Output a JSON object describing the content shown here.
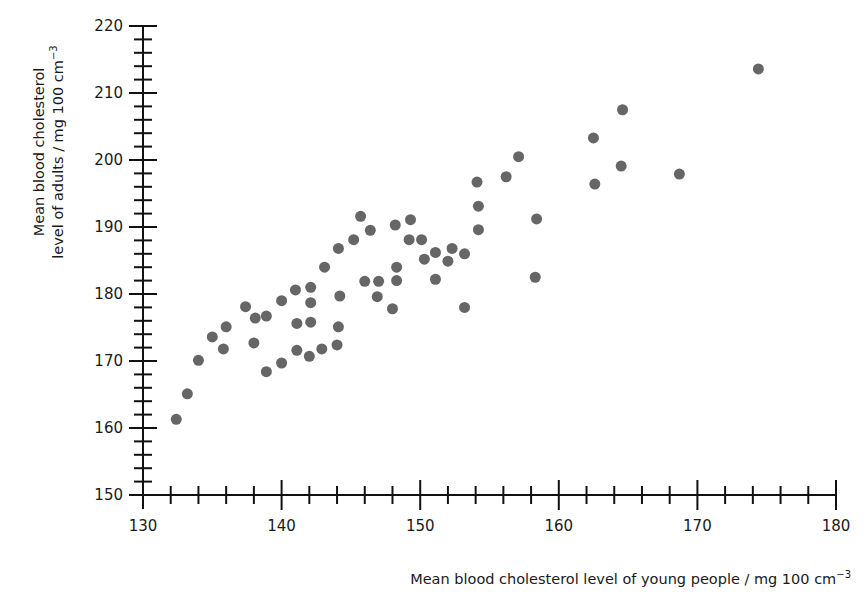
{
  "chart_data": {
    "type": "scatter",
    "title": "",
    "xlabel": "Mean blood cholesterol level of young people / mg 100 cm",
    "xlabel_sup": "−3",
    "ylabel_line1": "Mean blood cholesterol",
    "ylabel_line2": "level of adults / mg 100 cm",
    "ylabel_sup": "−3",
    "xlim": [
      130,
      180
    ],
    "ylim": [
      150,
      220
    ],
    "x_major_ticks": [
      130,
      140,
      150,
      160,
      170,
      180
    ],
    "x_minor_step": 2,
    "y_major_ticks": [
      150,
      160,
      170,
      180,
      190,
      200,
      210,
      220
    ],
    "y_minor_step": 2,
    "grid": false,
    "legend": null,
    "marker_color": "#666666",
    "series": [
      {
        "name": "countries",
        "points": [
          [
            132.4,
            161.3
          ],
          [
            133.2,
            165.1
          ],
          [
            134.0,
            170.1
          ],
          [
            135.0,
            173.6
          ],
          [
            135.8,
            171.8
          ],
          [
            136.0,
            175.1
          ],
          [
            137.4,
            178.1
          ],
          [
            138.1,
            176.4
          ],
          [
            138.9,
            176.7
          ],
          [
            138.0,
            172.7
          ],
          [
            138.9,
            168.4
          ],
          [
            140.0,
            179.0
          ],
          [
            140.0,
            169.7
          ],
          [
            141.0,
            180.6
          ],
          [
            142.1,
            181.0
          ],
          [
            141.1,
            175.6
          ],
          [
            142.1,
            178.7
          ],
          [
            142.1,
            175.8
          ],
          [
            141.1,
            171.6
          ],
          [
            142.0,
            170.7
          ],
          [
            142.9,
            171.8
          ],
          [
            143.1,
            184.0
          ],
          [
            144.2,
            179.7
          ],
          [
            144.1,
            175.1
          ],
          [
            144.0,
            172.4
          ],
          [
            144.1,
            186.8
          ],
          [
            145.2,
            188.1
          ],
          [
            145.7,
            191.6
          ],
          [
            146.4,
            189.5
          ],
          [
            146.0,
            181.9
          ],
          [
            147.0,
            181.9
          ],
          [
            146.9,
            179.6
          ],
          [
            148.2,
            190.3
          ],
          [
            148.3,
            184.0
          ],
          [
            148.3,
            182.0
          ],
          [
            148.0,
            177.8
          ],
          [
            149.3,
            191.1
          ],
          [
            149.2,
            188.1
          ],
          [
            150.1,
            188.1
          ],
          [
            150.3,
            185.2
          ],
          [
            151.1,
            186.2
          ],
          [
            151.1,
            182.2
          ],
          [
            152.0,
            184.9
          ],
          [
            152.3,
            186.8
          ],
          [
            153.2,
            186.0
          ],
          [
            153.2,
            178.0
          ],
          [
            154.1,
            196.7
          ],
          [
            154.2,
            193.1
          ],
          [
            154.2,
            189.6
          ],
          [
            156.2,
            197.5
          ],
          [
            157.1,
            200.5
          ],
          [
            158.4,
            191.2
          ],
          [
            158.3,
            182.5
          ],
          [
            162.5,
            203.3
          ],
          [
            162.6,
            196.4
          ],
          [
            164.6,
            207.5
          ],
          [
            164.5,
            199.1
          ],
          [
            168.7,
            197.9
          ],
          [
            174.4,
            213.6
          ]
        ]
      }
    ]
  }
}
